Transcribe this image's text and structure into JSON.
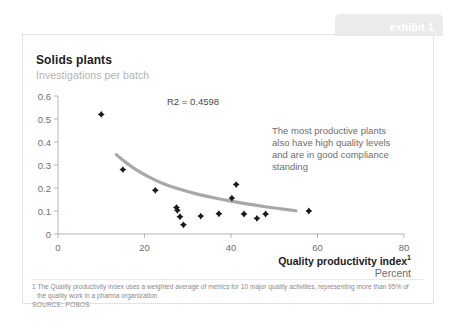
{
  "exhibit": {
    "label": "exhibit 1"
  },
  "chart": {
    "title": "Solids plants",
    "subtitle": "Investigations per batch",
    "r2_label": "R2 = 0.4598",
    "annotation": "The most productive plants also have high quality levels and are in good compliance standing",
    "annotation_lines": [
      "The most productive plants",
      "also have high quality levels",
      "and are in good compliance",
      "standing"
    ],
    "x_axis_title": "Quality productivity index",
    "x_axis_title_sup": "1",
    "x_axis_unit": "Percent"
  },
  "footnote": {
    "line1": "1 The Quality productivity index uses a weighted average of metrics for 10 major quality activities, representing more than 95% of",
    "line2": "the quality work in a pharma organization",
    "source": "SOURCE: POBOS"
  },
  "colors": {
    "marker": "#1a1a1a",
    "trendline": "#a8a8a8",
    "axis": "#b5b5b5",
    "tick_text": "#6e6e6e",
    "tab_bg": "#ebebeb",
    "title": "#1c1c1c",
    "subtitle": "#b3b3b3",
    "annotation": "#6e6e6e"
  },
  "chart_data": {
    "type": "scatter",
    "title": "Solids plants",
    "subtitle": "Investigations per batch",
    "xlabel": "Quality productivity index, Percent",
    "ylabel": "Investigations per batch",
    "xlim": [
      0,
      80
    ],
    "ylim": [
      0,
      0.6
    ],
    "xticks": [
      0,
      20,
      40,
      60,
      80
    ],
    "xtick_labels": [
      "0",
      "20",
      "40",
      "60",
      "80"
    ],
    "yticks": [
      0,
      0.1,
      0.2,
      0.3,
      0.4,
      0.5,
      0.6
    ],
    "ytick_labels": [
      "0",
      "0.1",
      "0.2",
      "0.3",
      "0.4",
      "0.5",
      "0.6"
    ],
    "grid": false,
    "legend": "none",
    "r_squared": 0.4598,
    "points": [
      {
        "x": 10.0,
        "y": 0.52
      },
      {
        "x": 15.0,
        "y": 0.28
      },
      {
        "x": 22.5,
        "y": 0.19
      },
      {
        "x": 27.4,
        "y": 0.115
      },
      {
        "x": 27.6,
        "y": 0.103
      },
      {
        "x": 28.2,
        "y": 0.075
      },
      {
        "x": 29.0,
        "y": 0.04
      },
      {
        "x": 33.0,
        "y": 0.078
      },
      {
        "x": 37.2,
        "y": 0.088
      },
      {
        "x": 40.2,
        "y": 0.156
      },
      {
        "x": 41.2,
        "y": 0.215
      },
      {
        "x": 43.0,
        "y": 0.087
      },
      {
        "x": 46.0,
        "y": 0.068
      },
      {
        "x": 48.0,
        "y": 0.087
      },
      {
        "x": 58.0,
        "y": 0.1
      }
    ],
    "trendline": {
      "type": "power",
      "points": [
        {
          "x": 13.5,
          "y": 0.345
        },
        {
          "x": 16.0,
          "y": 0.305
        },
        {
          "x": 19.0,
          "y": 0.268
        },
        {
          "x": 22.5,
          "y": 0.233
        },
        {
          "x": 26.0,
          "y": 0.207
        },
        {
          "x": 30.0,
          "y": 0.184
        },
        {
          "x": 34.0,
          "y": 0.165
        },
        {
          "x": 38.0,
          "y": 0.15
        },
        {
          "x": 42.0,
          "y": 0.136
        },
        {
          "x": 46.0,
          "y": 0.124
        },
        {
          "x": 50.0,
          "y": 0.113
        },
        {
          "x": 55.0,
          "y": 0.101
        }
      ]
    }
  }
}
